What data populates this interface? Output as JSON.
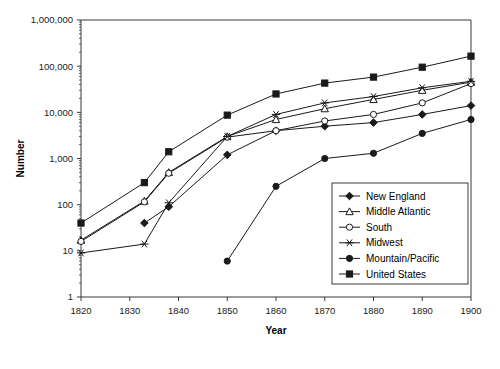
{
  "chart_data": {
    "type": "line",
    "title": "",
    "xlabel": "Year",
    "ylabel": "Number",
    "xlim": [
      1820,
      1900
    ],
    "ylim": [
      1,
      1000000
    ],
    "yscale": "log",
    "grid": false,
    "legend_position": "inside-lower-right",
    "xticks": [
      "1820",
      "1830",
      "1840",
      "1850",
      "1860",
      "1870",
      "1880",
      "1890",
      "1900"
    ],
    "xtick_values": [
      1820,
      1830,
      1840,
      1850,
      1860,
      1870,
      1880,
      1890,
      1900
    ],
    "yticks": [
      "1",
      "10",
      "100",
      "1,000",
      "10,000",
      "100,000",
      "1,000,000"
    ],
    "ytick_values": [
      1,
      10,
      100,
      1000,
      10000,
      100000,
      1000000
    ],
    "series": [
      {
        "name": "New England",
        "marker": "diamond-filled",
        "x": [
          1833,
          1838,
          1850,
          1860,
          1870,
          1880,
          1890,
          1900
        ],
        "values": [
          40,
          90,
          1200,
          4000,
          5000,
          6000,
          9000,
          14000
        ]
      },
      {
        "name": "Middle Atlantic",
        "marker": "triangle-open",
        "x": [
          1820,
          1833,
          1838,
          1850,
          1860,
          1870,
          1880,
          1890,
          1900
        ],
        "values": [
          17,
          120,
          500,
          3000,
          7000,
          12000,
          19000,
          30000,
          45000
        ]
      },
      {
        "name": "South",
        "marker": "circle-open",
        "x": [
          1820,
          1833,
          1838,
          1850,
          1860,
          1870,
          1880,
          1890,
          1900
        ],
        "values": [
          16,
          115,
          480,
          2900,
          4000,
          6500,
          9000,
          16000,
          42000
        ]
      },
      {
        "name": "Midwest",
        "marker": "asterisk",
        "x": [
          1820,
          1833,
          1838,
          1850,
          1860,
          1870,
          1880,
          1890,
          1900
        ],
        "values": [
          9,
          14,
          110,
          3000,
          9000,
          16000,
          22000,
          34000,
          47000
        ]
      },
      {
        "name": "Mountain/Pacific",
        "marker": "circle-filled",
        "x": [
          1850,
          1860,
          1870,
          1880,
          1890,
          1900
        ],
        "values": [
          6,
          250,
          1000,
          1300,
          3500,
          7000
        ]
      },
      {
        "name": "United States",
        "marker": "square-filled",
        "x": [
          1820,
          1833,
          1838,
          1850,
          1860,
          1870,
          1880,
          1890,
          1900
        ],
        "values": [
          40,
          300,
          1400,
          8700,
          25000,
          43000,
          58000,
          95000,
          165000
        ]
      }
    ]
  },
  "legend": {
    "items": [
      {
        "label": "New England"
      },
      {
        "label": "Middle Atlantic"
      },
      {
        "label": "South"
      },
      {
        "label": "Midwest"
      },
      {
        "label": "Mountain/Pacific"
      },
      {
        "label": "United States"
      }
    ]
  },
  "colors": {
    "ink": "#1a1a1a",
    "axis": "#3a3a3a",
    "background": "#ffffff"
  }
}
